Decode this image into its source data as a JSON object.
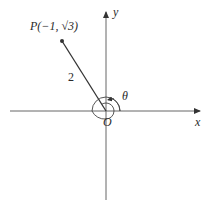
{
  "diagram": {
    "type": "polar-angle-diagram",
    "axes": {
      "x_label": "x",
      "y_label": "y",
      "origin_label": "O"
    },
    "point": {
      "label": "P(−1, √3)",
      "label_name": "P",
      "x": -1,
      "y_text": "√3"
    },
    "segment": {
      "length_label": "2"
    },
    "angle": {
      "label": "θ",
      "description": "angle measured counterclockwise from positive x-axis, more than one full turn"
    },
    "colors": {
      "stroke": "#555555",
      "text": "#2a2a2a",
      "background": "#ffffff"
    }
  }
}
